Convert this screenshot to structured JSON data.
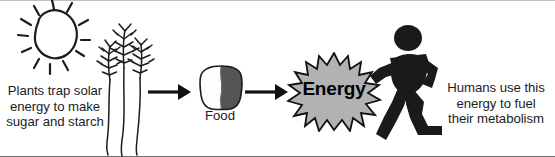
{
  "figure": {
    "background_color": "#ffffff",
    "ink_color": "#1c1c1c",
    "burst_fill_color": "#b2b2b2",
    "bread_crust_color": "#555555",
    "silhouette_color": "#1a1a1a"
  },
  "stage_left": {
    "caption": "Plants trap solar\nenergy to make\nsugar and starch",
    "sun_icon": "sun-icon",
    "wheat_icon": "wheat-stalks-icon"
  },
  "stage_middle": {
    "food_label": "Food",
    "bread_icon": "bread-slice-icon"
  },
  "stage_energy": {
    "burst_label": "Energy",
    "burst_icon": "starburst-icon"
  },
  "stage_right": {
    "caption": "Humans use this\nenergy to fuel\ntheir metabolism",
    "runner_icon": "running-person-icon"
  },
  "arrows": [
    {
      "name": "arrow-plants-to-food",
      "direction": "right"
    },
    {
      "name": "arrow-food-to-energy",
      "direction": "right"
    }
  ]
}
